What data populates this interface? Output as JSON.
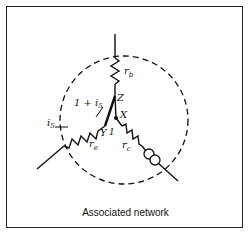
{
  "figure": {
    "caption": "Associated network",
    "labels": {
      "rb": "r",
      "rb_sub": "b",
      "re": "r",
      "re_sub": "e",
      "rc": "r",
      "rc_sub": "c",
      "node_z": "Z",
      "node_x": "X",
      "node_y": "Y",
      "one": "1",
      "current_top": "1 + i",
      "current_top_sub": "5",
      "current_left": "i",
      "current_left_sub": "5"
    },
    "colors": {
      "line": "#111111",
      "background": "#ffffff"
    }
  }
}
